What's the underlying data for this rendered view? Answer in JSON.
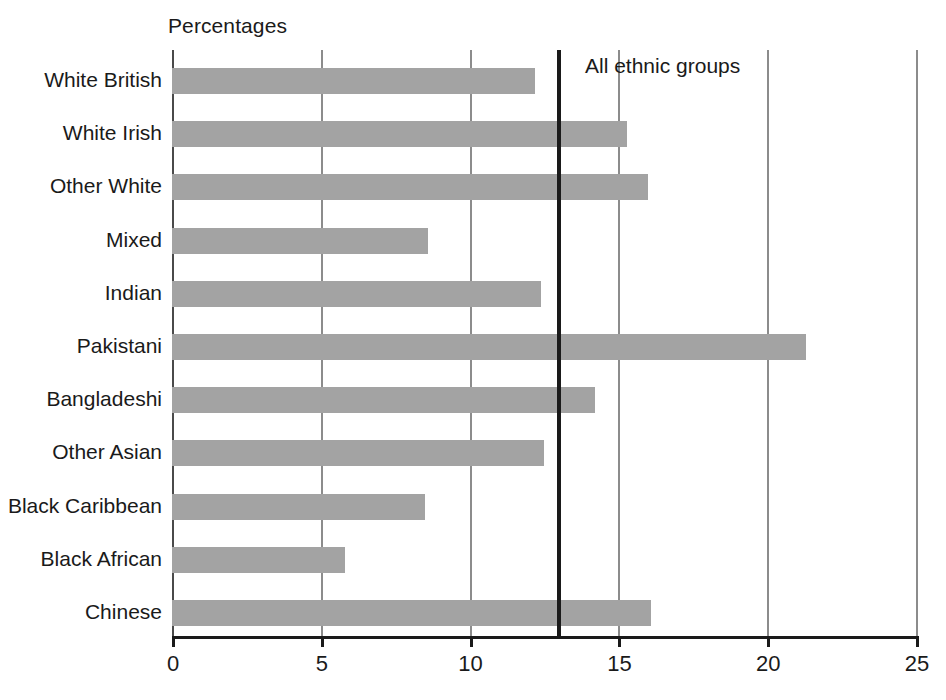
{
  "chart_data": {
    "type": "bar",
    "orientation": "horizontal",
    "title": "",
    "xlabel": "Percentages",
    "ylabel": "",
    "xlim": [
      0,
      25
    ],
    "xticks": [
      0,
      5,
      10,
      15,
      20,
      25
    ],
    "xtick_labels": [
      "0",
      "5",
      "10",
      "15",
      "20",
      "25"
    ],
    "grid": true,
    "grid_axis": "x",
    "legend": "none",
    "bar_color": "#a3a3a3",
    "categories": [
      "White British",
      "White Irish",
      "Other White",
      "Mixed",
      "Indian",
      "Pakistani",
      "Bangladeshi",
      "Other Asian",
      "Black Caribbean",
      "Black African",
      "Chinese"
    ],
    "values": [
      12.2,
      15.3,
      16.0,
      8.6,
      12.4,
      21.3,
      14.2,
      12.5,
      8.5,
      5.8,
      16.1
    ],
    "annotations": [
      {
        "name": "all-ethnic-groups-reference",
        "label": "All ethnic groups",
        "value": 13.0,
        "style": "vertical-line",
        "color": "#1a1a1a"
      }
    ]
  },
  "axis": {
    "title": "Percentages"
  },
  "reference": {
    "label": "All ethnic groups"
  }
}
